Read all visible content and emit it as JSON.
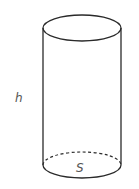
{
  "diagram": {
    "shape": "cylinder",
    "labels": {
      "height": "h",
      "base_area": "S"
    },
    "colors": {
      "stroke": "#2a2a2a",
      "label": "#555555",
      "background": "#ffffff"
    }
  }
}
